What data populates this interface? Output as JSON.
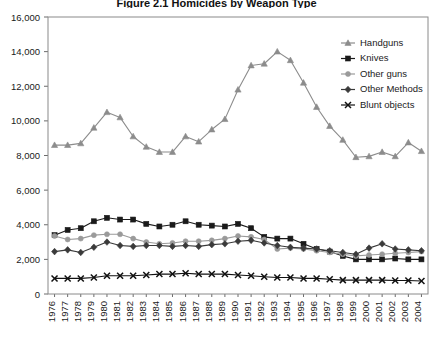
{
  "chart_data": {
    "type": "line",
    "title": "Figure 2.1 Homicides by Weapon Type",
    "xlabel": "",
    "ylabel": "",
    "ylim": [
      0,
      16000
    ],
    "ytick_step": 2000,
    "grid": false,
    "legend_position": "top-right",
    "categories": [
      "1976",
      "1977",
      "1978",
      "1979",
      "1980",
      "1981",
      "1982",
      "1983",
      "1984",
      "1985",
      "1986",
      "1987",
      "1988",
      "1989",
      "1990",
      "1991",
      "1992",
      "1993",
      "1994",
      "1995",
      "1996",
      "1997",
      "1998",
      "1999",
      "2000",
      "2001",
      "2002",
      "2003",
      "2004"
    ],
    "ytick_labels": [
      "0",
      "2,000",
      "4,000",
      "6,000",
      "8,000",
      "10,000",
      "12,000",
      "14,000",
      "16,000"
    ],
    "ytick_values": [
      0,
      2000,
      4000,
      6000,
      8000,
      10000,
      12000,
      14000,
      16000
    ],
    "series": [
      {
        "name": "Handguns",
        "color": "#8c8c8c",
        "marker": "triangle",
        "values": [
          8600,
          8600,
          8700,
          9600,
          10500,
          10200,
          9100,
          8500,
          8200,
          8200,
          9100,
          8800,
          9500,
          10100,
          11800,
          13200,
          13300,
          14000,
          13500,
          12200,
          10800,
          9700,
          8900,
          7900,
          7950,
          8200,
          7950,
          8750,
          8250
        ]
      },
      {
        "name": "Knives",
        "color": "#1a1a1a",
        "marker": "square",
        "values": [
          3400,
          3700,
          3800,
          4200,
          4400,
          4300,
          4300,
          4050,
          3900,
          4000,
          4200,
          4000,
          3950,
          3900,
          4050,
          3800,
          3300,
          3200,
          3200,
          2900,
          2600,
          2450,
          2200,
          2000,
          2000,
          2000,
          2050,
          2000,
          2000
        ]
      },
      {
        "name": "Other guns",
        "color": "#9a9a9a",
        "marker": "circle",
        "values": [
          3350,
          3150,
          3200,
          3400,
          3450,
          3450,
          3200,
          3000,
          2900,
          2950,
          3050,
          3050,
          3100,
          3200,
          3350,
          3300,
          3150,
          2600,
          2650,
          2600,
          2500,
          2400,
          2300,
          2200,
          2250,
          2300,
          2350,
          2400,
          2450
        ]
      },
      {
        "name": "Other Methods",
        "color": "#3a3a3a",
        "marker": "diamond",
        "values": [
          2450,
          2550,
          2400,
          2700,
          3000,
          2800,
          2750,
          2800,
          2800,
          2750,
          2800,
          2750,
          2850,
          2900,
          3050,
          3100,
          2950,
          2800,
          2700,
          2650,
          2600,
          2500,
          2400,
          2300,
          2650,
          2900,
          2600,
          2550,
          2500
        ]
      },
      {
        "name": "Blunt objects",
        "color": "#111111",
        "marker": "x",
        "values": [
          900,
          900,
          900,
          950,
          1050,
          1050,
          1050,
          1100,
          1150,
          1150,
          1200,
          1150,
          1150,
          1150,
          1100,
          1050,
          1000,
          950,
          950,
          900,
          900,
          850,
          800,
          800,
          800,
          800,
          780,
          780,
          750
        ]
      }
    ]
  }
}
